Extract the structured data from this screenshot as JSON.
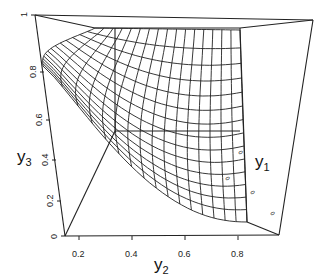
{
  "chart_data": {
    "type": "surface3d",
    "title": "",
    "xlabel": "y2",
    "ylabel": "y1",
    "zlabel": "y3",
    "axes": {
      "y2": {
        "ticks": [
          "0.2",
          "0.4",
          "0.6",
          "0.8"
        ],
        "range": [
          0.1,
          1.0
        ]
      },
      "y3": {
        "ticks": [
          "0",
          "0.2",
          "0.4",
          "0.6",
          "0.8",
          "1"
        ],
        "range": [
          0,
          1
        ]
      },
      "y1": {
        "ticks": [
          "0",
          "0",
          "0",
          "0"
        ],
        "range": [
          0,
          1
        ]
      }
    },
    "surface": {
      "description": "Wireframe surface decreasing in y3 as y2 increases, forming a convex curved mesh (hyperbolic-like constraint surface y1*y2*y3 style)",
      "grid_rows": 14,
      "grid_cols": 16
    },
    "grid": false,
    "legend": null
  },
  "labels": {
    "x_axis": "y",
    "x_sub": "2",
    "z_axis": "y",
    "z_sub": "3",
    "y_axis": "y",
    "y_sub": "1"
  }
}
